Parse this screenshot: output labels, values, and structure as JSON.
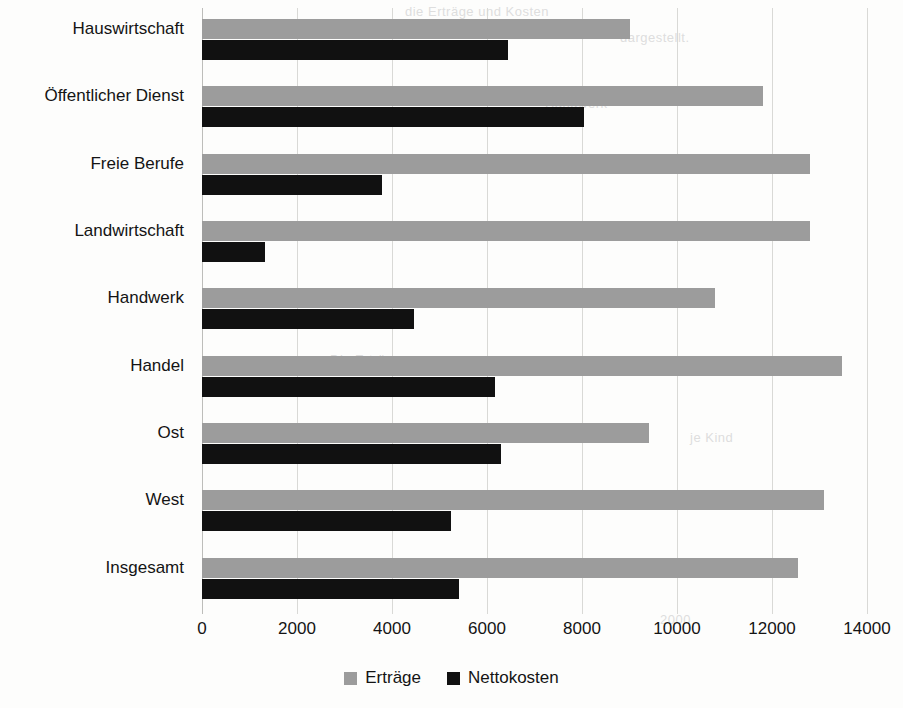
{
  "chart_data": {
    "type": "bar",
    "orientation": "horizontal",
    "title": "",
    "xlabel": "",
    "ylabel": "",
    "xlim": [
      0,
      14000
    ],
    "xticks": [
      0,
      2000,
      4000,
      6000,
      8000,
      10000,
      12000,
      14000
    ],
    "xtick_labels": [
      "0",
      "2000",
      "4000",
      "6000",
      "8000",
      "10000",
      "12000",
      "14000"
    ],
    "grid": true,
    "legend_position": "bottom",
    "categories": [
      "Hauswirtschaft",
      "Öffentlicher Dienst",
      "Freie Berufe",
      "Landwirtschaft",
      "Handwerk",
      "Handel",
      "Ost",
      "West",
      "Insgesamt"
    ],
    "series": [
      {
        "name": "Erträge",
        "color": "#9c9c9c",
        "values": [
          9000,
          11800,
          12800,
          12800,
          10800,
          13480,
          9400,
          13100,
          12550
        ]
      },
      {
        "name": "Nettokosten",
        "color": "#111111",
        "values": [
          6450,
          8050,
          3780,
          1330,
          4470,
          6160,
          6300,
          5250,
          5400
        ]
      }
    ]
  },
  "legend": {
    "items": [
      {
        "label": "Erträge",
        "swatch": "ertraege"
      },
      {
        "label": "Nettokosten",
        "swatch": "nettokosten"
      }
    ]
  },
  "bleed_text": [
    {
      "text": "die Erträge und Kosten",
      "x": 405,
      "y": 4
    },
    {
      "text": "dargestellt.",
      "x": 620,
      "y": 30
    },
    {
      "text": "Handwerk",
      "x": 545,
      "y": 96
    },
    {
      "text": "Die Erträge",
      "x": 330,
      "y": 352
    },
    {
      "text": "je Kind",
      "x": 690,
      "y": 430
    },
    {
      "text": "2000",
      "x": 660,
      "y": 612
    }
  ]
}
